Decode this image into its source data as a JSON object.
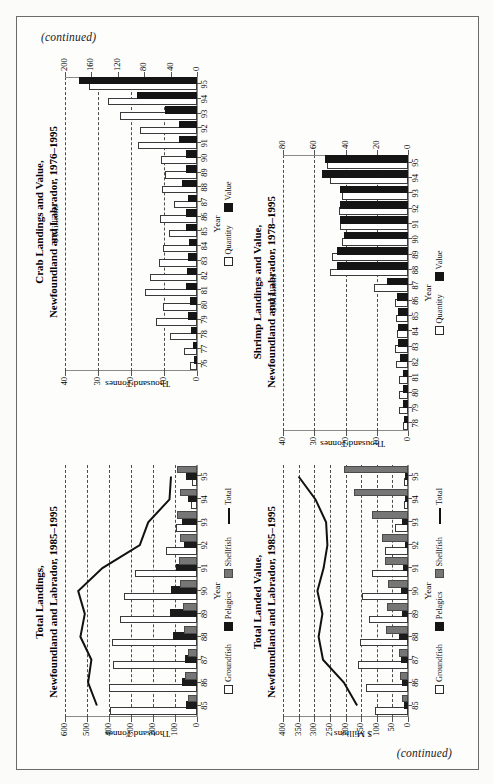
{
  "page": {
    "continued_top": "(continued)",
    "continued_bottom": "(continued)",
    "background": "#fdfdfc",
    "border_color": "#6b6b6b"
  },
  "legends": {
    "quantity": "Quantity",
    "value": "Value",
    "groundfish": "Groundfish",
    "pelagics": "Pelagics",
    "shellfish": "Shellfish",
    "total": "Total"
  },
  "axis_titles": {
    "year": "Year",
    "thousand_tonnes": "Thousand Tonnes",
    "dollar_millions": "$ Millions",
    "millions_dollar": "$ Millions"
  },
  "chart_data": [
    {
      "id": "crab",
      "type": "bar",
      "title_line1": "Crab Landings and Value,",
      "title_line2": "Newfoundland and Labrador, 1976–1995",
      "xlabel": "Year",
      "ylabel": "Thousand Tonnes",
      "y2label": "$ Millions",
      "ylim": [
        0,
        40
      ],
      "yticks": [
        0,
        10,
        20,
        30,
        40
      ],
      "y2lim": [
        0,
        200
      ],
      "y2ticks": [
        0,
        40,
        80,
        120,
        160,
        200
      ],
      "categories": [
        "76",
        "77",
        "78",
        "79",
        "80",
        "81",
        "82",
        "83",
        "84",
        "85",
        "86",
        "87",
        "88",
        "89",
        "90",
        "91",
        "92",
        "93",
        "94",
        "95"
      ],
      "series": [
        {
          "name": "Quantity",
          "unit": "Thousand Tonnes",
          "values": [
            1.6,
            3.2,
            7.6,
            11.8,
            9.8,
            15.2,
            13.6,
            11.0,
            9.6,
            7.8,
            10.6,
            6.4,
            10.0,
            9.0,
            10.2,
            17.2,
            16.6,
            22.8,
            26.4,
            32.2
          ]
        },
        {
          "name": "Value",
          "unit": "$ Millions",
          "values": [
            1.5,
            3.0,
            6.0,
            10.0,
            8.0,
            13.0,
            12.0,
            11.0,
            9.0,
            14.0,
            13.0,
            11.0,
            20.0,
            14.0,
            13.0,
            24.0,
            24.0,
            45.0,
            88.0,
            176.0
          ]
        }
      ]
    },
    {
      "id": "shrimp",
      "type": "bar",
      "title_line1": "Shrimp Landings and Value,",
      "title_line2": "Newfoundland and Labrador, 1978–1995",
      "xlabel": "Year",
      "ylabel": "Thousand Tonnes",
      "y2label": "$ Millions",
      "ylim": [
        0,
        40
      ],
      "yticks": [
        0,
        10,
        20,
        30,
        40
      ],
      "y2lim": [
        0,
        80
      ],
      "y2ticks": [
        0,
        20,
        40,
        60,
        80
      ],
      "categories": [
        "78",
        "79",
        "80",
        "81",
        "82",
        "83",
        "84",
        "85",
        "86",
        "87",
        "88",
        "89",
        "90",
        "91",
        "92",
        "93",
        "94",
        "95"
      ],
      "series": [
        {
          "name": "Quantity",
          "unit": "Thousand Tonnes",
          "values": [
            1.0,
            2.2,
            2.4,
            2.2,
            3.2,
            3.4,
            3.0,
            3.2,
            3.6,
            10.4,
            24.4,
            23.6,
            20.6,
            21.0,
            21.4,
            20.6,
            24.2,
            25.4
          ]
        },
        {
          "name": "Value",
          "unit": "$ Millions",
          "values": [
            1.0,
            2.0,
            2.0,
            2.0,
            4.0,
            5.0,
            5.0,
            5.0,
            6.0,
            12.0,
            44.0,
            44.0,
            40.0,
            42.0,
            42.0,
            42.0,
            54.0,
            52.0
          ]
        }
      ]
    },
    {
      "id": "total-landings",
      "type": "bar",
      "title_line1": "Total Landings,",
      "title_line2": "Newfoundland and Labrador, 1985–1995",
      "xlabel": "Year",
      "ylabel": "Thousand Tonnes",
      "ylim": [
        0,
        600
      ],
      "yticks": [
        0,
        100,
        200,
        300,
        400,
        500,
        600
      ],
      "categories": [
        "85",
        "86",
        "87",
        "88",
        "89",
        "90",
        "91",
        "92",
        "93",
        "94",
        "95"
      ],
      "series": [
        {
          "name": "Groundfish",
          "values": [
            385,
            390,
            375,
            378,
            340,
            322,
            272,
            130,
            85,
            20,
            14
          ]
        },
        {
          "name": "Pelagics",
          "values": [
            40,
            60,
            44,
            102,
            115,
            108,
            86,
            48,
            58,
            34,
            40
          ]
        },
        {
          "name": "Shellfish",
          "values": [
            30,
            45,
            30,
            50,
            55,
            70,
            72,
            70,
            82,
            68,
            82
          ]
        },
        {
          "name": "Total",
          "type": "line",
          "values": [
            455,
            495,
            480,
            530,
            510,
            540,
            430,
            260,
            222,
            125,
            118
          ]
        }
      ]
    },
    {
      "id": "total-landed-value",
      "type": "bar",
      "title_line1": "Total Landed Value,",
      "title_line2": "Newfoundland and Labrador, 1985–1995",
      "xlabel": "Year",
      "ylabel": "$ Millions",
      "ylim": [
        0,
        400
      ],
      "yticks": [
        0,
        50,
        100,
        150,
        200,
        250,
        300,
        350,
        400
      ],
      "categories": [
        "85",
        "86",
        "87",
        "88",
        "89",
        "90",
        "91",
        "92",
        "93",
        "94",
        "95"
      ],
      "series": [
        {
          "name": "Groundfish",
          "values": [
            100,
            128,
            155,
            148,
            120,
            142,
            110,
            68,
            36,
            6,
            5
          ]
        },
        {
          "name": "Pelagics",
          "values": [
            5,
            14,
            16,
            24,
            13,
            16,
            10,
            4,
            14,
            4,
            4
          ]
        },
        {
          "name": "Shellfish",
          "values": [
            14,
            20,
            24,
            63,
            60,
            58,
            68,
            77,
            108,
            167,
            198
          ]
        },
        {
          "name": "Total",
          "type": "line",
          "values": [
            163,
            205,
            272,
            286,
            274,
            290,
            270,
            258,
            262,
            296,
            350
          ]
        }
      ]
    }
  ]
}
